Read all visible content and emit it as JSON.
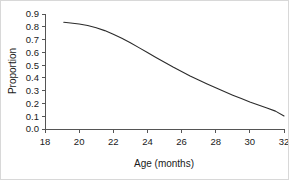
{
  "chart_data": {
    "type": "line",
    "title": "",
    "xlabel": "Age (months)",
    "ylabel": "Proportion",
    "xlim": [
      18,
      32
    ],
    "ylim": [
      0.0,
      0.9
    ],
    "grid": false,
    "legend": null,
    "legend_position": "none",
    "x_ticks": [
      18,
      20,
      22,
      24,
      26,
      28,
      30,
      32
    ],
    "x_tick_labels": [
      "18",
      "20",
      "22",
      "24",
      "26",
      "28",
      "30",
      "32"
    ],
    "y_ticks": [
      0.0,
      0.1,
      0.2,
      0.3,
      0.4,
      0.5,
      0.6,
      0.7,
      0.8,
      0.9
    ],
    "y_tick_labels": [
      "0.0",
      "0.1",
      "0.2",
      "0.3",
      "0.4",
      "0.5",
      "0.6",
      "0.7",
      "0.8",
      "0.9"
    ],
    "series": [
      {
        "name": "proportion-curve",
        "color": "#2b2b2b",
        "x": [
          19.1,
          19.5,
          20.0,
          20.5,
          21.0,
          21.5,
          22.0,
          22.5,
          23.0,
          23.5,
          24.0,
          24.5,
          25.0,
          25.5,
          26.0,
          26.5,
          27.0,
          27.5,
          28.0,
          28.5,
          29.0,
          29.5,
          30.0,
          30.5,
          31.0,
          31.5,
          32.0
        ],
        "values": [
          0.835,
          0.83,
          0.822,
          0.81,
          0.792,
          0.77,
          0.742,
          0.71,
          0.675,
          0.637,
          0.598,
          0.56,
          0.522,
          0.485,
          0.45,
          0.415,
          0.383,
          0.352,
          0.322,
          0.293,
          0.265,
          0.238,
          0.212,
          0.188,
          0.165,
          0.14,
          0.102
        ]
      }
    ]
  },
  "axes": {
    "y_axis_title": "Proportion",
    "x_axis_title": "Age (months)"
  }
}
